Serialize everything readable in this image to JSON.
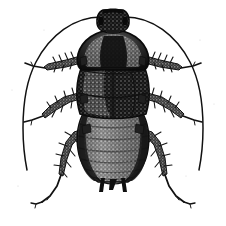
{
  "image": {
    "subject": "cockroach",
    "view": "dorsal",
    "style": "black-and-white line engraving with stipple shading",
    "background_color": "#ffffff",
    "ink_color": "#111111",
    "width": 226,
    "height": 226,
    "has_text": false,
    "has_border": false
  },
  "anatomy": {
    "head": {
      "name": "head-capsule",
      "shape": "rounded trapezoid",
      "tone": "dark mottled",
      "center_x": 113,
      "center_y": 22
    },
    "pronotum": {
      "name": "pronotum-shield",
      "shape": "broad shield",
      "tone": "dark with light speckled mottling",
      "center_x": 113,
      "center_y": 52
    },
    "tegmina": {
      "name": "tegmina-forewings",
      "shape": "short overlapping wing pads",
      "tone": "dark grey stipple",
      "center_x": 113,
      "center_y": 92
    },
    "abdomen": {
      "name": "abdomen-segments",
      "segment_count": 7,
      "tone": "banded grey stipple with dark margins",
      "center_x": 113,
      "center_y": 145
    },
    "cerci": {
      "name": "cerci-pair",
      "count": 2,
      "center_x": 113,
      "center_y": 180
    },
    "antennae": {
      "name": "antennae-pair",
      "count": 2,
      "description": "long thin arcs sweeping outward and downward past mid-body"
    },
    "legs": {
      "name": "legs",
      "pair_count": 3,
      "pairs": [
        {
          "label": "fore-legs",
          "position": "upper",
          "spined": true
        },
        {
          "label": "mid-legs",
          "position": "middle",
          "spined": true
        },
        {
          "label": "hind-legs",
          "position": "lower",
          "spined": true
        }
      ]
    }
  },
  "palette": {
    "ink": "#111111",
    "ink_soft": "#2b2b2b",
    "paper": "#ffffff"
  }
}
